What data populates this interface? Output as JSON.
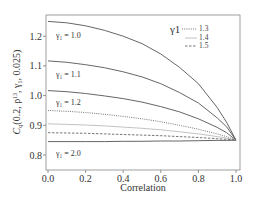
{
  "chart_data": {
    "type": "line",
    "title": "",
    "xlabel": "Correlation",
    "ylabel": "C_q(0.2, ρ^13, γ1, 0.025)",
    "xlim": [
      0.0,
      1.0
    ],
    "ylim": [
      0.78,
      1.27
    ],
    "x_ticks": [
      "0.0",
      "0.2",
      "0.4",
      "0.6",
      "0.8",
      "1.0"
    ],
    "y_ticks": [
      "0.8",
      "0.9",
      "1.0",
      "1.1",
      "1.2"
    ],
    "grid": false,
    "legend": {
      "title": "γ1",
      "position": "upper right",
      "entries": [
        {
          "label": "1.3",
          "style": "dotted"
        },
        {
          "label": "1.4",
          "style": "solid-light"
        },
        {
          "label": "1.5",
          "style": "dashed"
        }
      ]
    },
    "annotations": [
      "γ1 = 1.0",
      "γ1 = 1.1",
      "γ1 = 1.2",
      "γ1 = 2.0"
    ],
    "x": [
      0.0,
      0.1,
      0.2,
      0.3,
      0.4,
      0.5,
      0.6,
      0.7,
      0.8,
      0.9,
      0.95,
      1.0
    ],
    "series": [
      {
        "name": "γ1 = 1.0",
        "style": "solid",
        "values": [
          1.25,
          1.245,
          1.235,
          1.22,
          1.2,
          1.175,
          1.14,
          1.095,
          1.04,
          0.96,
          0.91,
          0.85
        ]
      },
      {
        "name": "γ1 = 1.1",
        "style": "solid",
        "values": [
          1.117,
          1.112,
          1.104,
          1.094,
          1.08,
          1.063,
          1.04,
          1.01,
          0.975,
          0.925,
          0.895,
          0.85
        ]
      },
      {
        "name": "γ1 = 1.2",
        "style": "solid",
        "values": [
          1.017,
          1.013,
          1.007,
          0.999,
          0.99,
          0.978,
          0.963,
          0.945,
          0.922,
          0.893,
          0.875,
          0.85
        ]
      },
      {
        "name": "γ1 = 1.3",
        "style": "dotted",
        "values": [
          0.95,
          0.947,
          0.943,
          0.937,
          0.93,
          0.922,
          0.912,
          0.9,
          0.887,
          0.871,
          0.862,
          0.85
        ]
      },
      {
        "name": "γ1 = 1.4",
        "style": "solid-light",
        "values": [
          0.905,
          0.903,
          0.901,
          0.898,
          0.894,
          0.89,
          0.885,
          0.878,
          0.871,
          0.862,
          0.857,
          0.85
        ]
      },
      {
        "name": "γ1 = 1.5",
        "style": "dashed",
        "values": [
          0.875,
          0.874,
          0.873,
          0.871,
          0.869,
          0.867,
          0.865,
          0.862,
          0.859,
          0.855,
          0.853,
          0.85
        ]
      },
      {
        "name": "γ1 = 2.0",
        "style": "solid",
        "values": [
          0.845,
          0.845,
          0.845,
          0.845,
          0.846,
          0.846,
          0.847,
          0.847,
          0.848,
          0.849,
          0.849,
          0.85
        ]
      }
    ]
  },
  "labels": {
    "xlabel": "Correlation",
    "ylabel_prefix": "C",
    "ylabel_sub": "q",
    "ylabel_rest1": "(0.2, ρ",
    "ylabel_sup": "13",
    "ylabel_rest2": ", γ",
    "ylabel_sub2": "1",
    "ylabel_rest3": ", 0.025)",
    "ann_10": "γ₁ = 1.0",
    "ann_11": "γ₁ = 1.1",
    "ann_12": "γ₁ = 1.2",
    "ann_20": "γ₁ = 2.0",
    "legend_title": "γ1",
    "legend_13": "1.3",
    "legend_14": "1.4",
    "legend_15": "1.5"
  },
  "colors": {
    "solid": "#555555",
    "light": "#bbbbbb",
    "dash": "#666666",
    "frame": "#777777"
  }
}
